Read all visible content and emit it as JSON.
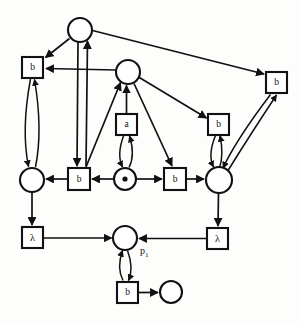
{
  "diagram": {
    "kind": "petri-net",
    "title": "",
    "colors": {
      "stroke": "#111111",
      "fill": "#ffffff",
      "background": "#fdfdfb",
      "token": "#111111"
    },
    "places": [
      {
        "id": "p_top",
        "label": "",
        "cx": 80,
        "cy": 30,
        "r": 12,
        "tokens": 0
      },
      {
        "id": "p_mid",
        "label": "",
        "cx": 128,
        "cy": 72,
        "r": 12,
        "tokens": 0
      },
      {
        "id": "p_left",
        "label": "",
        "cx": 32,
        "cy": 180,
        "r": 12,
        "tokens": 0
      },
      {
        "id": "p_center",
        "label": "",
        "cx": 125,
        "cy": 179,
        "r": 11,
        "tokens": 1
      },
      {
        "id": "p_right",
        "label": "",
        "cx": 219,
        "cy": 180,
        "r": 13,
        "tokens": 0
      },
      {
        "id": "p_1",
        "label": "p1",
        "cx": 125,
        "cy": 238,
        "r": 12,
        "tokens": 0
      },
      {
        "id": "p_bottomright",
        "label": "",
        "cx": 171,
        "cy": 292,
        "r": 11,
        "tokens": 0
      }
    ],
    "place_labels": [
      {
        "for": "p_1",
        "text": "p",
        "subscript": "1",
        "x": 140,
        "y": 252
      }
    ],
    "transitions": [
      {
        "id": "t_b_topleft",
        "label": "b",
        "x": 22,
        "y": 57,
        "w": 21,
        "h": 21
      },
      {
        "id": "t_b_topright",
        "label": "b",
        "x": 266,
        "y": 72,
        "w": 21,
        "h": 21
      },
      {
        "id": "t_a_center",
        "label": "a",
        "x": 116,
        "y": 114,
        "w": 21,
        "h": 21
      },
      {
        "id": "t_b_midright",
        "label": "b",
        "x": 208,
        "y": 114,
        "w": 21,
        "h": 21
      },
      {
        "id": "t_b_rowleft",
        "label": "b",
        "x": 68,
        "y": 168,
        "w": 22,
        "h": 22
      },
      {
        "id": "t_b_rowright",
        "label": "b",
        "x": 164,
        "y": 168,
        "w": 22,
        "h": 22
      },
      {
        "id": "t_lambda_left",
        "label": "λ",
        "x": 22,
        "y": 227,
        "w": 21,
        "h": 21
      },
      {
        "id": "t_lambda_right",
        "label": "λ",
        "x": 207,
        "y": 228,
        "w": 21,
        "h": 21
      },
      {
        "id": "t_b_bottom",
        "label": "b",
        "x": 117,
        "y": 282,
        "w": 21,
        "h": 21
      }
    ],
    "arcs": [
      {
        "from": "p_top",
        "to": "t_b_topleft",
        "type": "straight"
      },
      {
        "from": "p_top",
        "to": "t_b_topright",
        "type": "straight"
      },
      {
        "from": "p_top",
        "to": "t_b_rowleft",
        "type": "straight"
      },
      {
        "from": "t_b_rowleft",
        "to": "p_top",
        "type": "straight"
      },
      {
        "from": "p_mid",
        "to": "t_b_topleft",
        "type": "straight"
      },
      {
        "from": "p_mid",
        "to": "t_b_midright",
        "type": "straight"
      },
      {
        "from": "p_mid",
        "to": "t_b_rowright",
        "type": "straight"
      },
      {
        "from": "t_a_center",
        "to": "p_mid",
        "type": "straight"
      },
      {
        "from": "p_center",
        "to": "p_mid",
        "type": "straight"
      },
      {
        "from": "t_b_topleft",
        "to": "p_left",
        "type": "double-bow"
      },
      {
        "from": "p_left",
        "to": "t_b_topleft",
        "type": "double-bow"
      },
      {
        "from": "t_a_center",
        "to": "p_center",
        "type": "double-bow"
      },
      {
        "from": "p_center",
        "to": "t_a_center",
        "type": "double-bow"
      },
      {
        "from": "t_b_midright",
        "to": "p_right",
        "type": "double-bow"
      },
      {
        "from": "p_right",
        "to": "t_b_midright",
        "type": "double-bow"
      },
      {
        "from": "t_b_topright",
        "to": "p_right",
        "type": "double-bow"
      },
      {
        "from": "p_right",
        "to": "t_b_topright",
        "type": "double-bow"
      },
      {
        "from": "t_b_rowleft",
        "to": "p_left",
        "type": "straight"
      },
      {
        "from": "p_center",
        "to": "t_b_rowleft",
        "type": "straight"
      },
      {
        "from": "p_center",
        "to": "t_b_rowright",
        "type": "straight"
      },
      {
        "from": "t_b_rowright",
        "to": "p_right",
        "type": "straight"
      },
      {
        "from": "p_left",
        "to": "t_lambda_left",
        "type": "straight"
      },
      {
        "from": "p_right",
        "to": "t_lambda_right",
        "type": "straight"
      },
      {
        "from": "t_lambda_left",
        "to": "p_1",
        "type": "straight"
      },
      {
        "from": "t_lambda_right",
        "to": "p_1",
        "type": "straight"
      },
      {
        "from": "p_1",
        "to": "t_b_bottom",
        "type": "double-bow"
      },
      {
        "from": "t_b_bottom",
        "to": "p_1",
        "type": "double-bow"
      },
      {
        "from": "t_b_bottom",
        "to": "p_bottomright",
        "type": "straight"
      }
    ]
  }
}
